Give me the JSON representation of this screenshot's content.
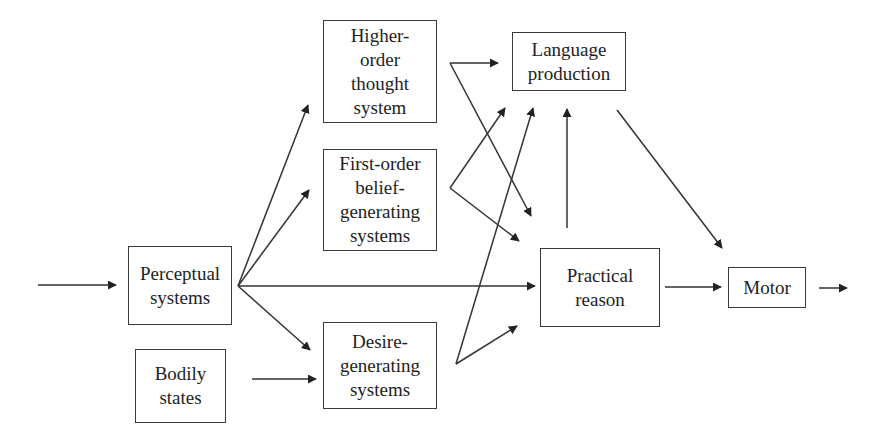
{
  "diagram": {
    "nodes": [
      {
        "id": "perceptual",
        "label": "Perceptual\nsystems"
      },
      {
        "id": "bodily",
        "label": "Bodily\nstates"
      },
      {
        "id": "higher_order",
        "label": "Higher-\norder\nthought\nsystem"
      },
      {
        "id": "first_order",
        "label": "First-order\nbelief-\ngenerating\nsystems"
      },
      {
        "id": "desire",
        "label": "Desire-\ngenerating\nsystems"
      },
      {
        "id": "language",
        "label": "Language\nproduction"
      },
      {
        "id": "practical",
        "label": "Practical\nreason"
      },
      {
        "id": "motor",
        "label": "Motor"
      }
    ],
    "edges": [
      {
        "from": "input",
        "to": "perceptual"
      },
      {
        "from": "perceptual",
        "to": "higher_order"
      },
      {
        "from": "perceptual",
        "to": "first_order"
      },
      {
        "from": "perceptual",
        "to": "practical"
      },
      {
        "from": "perceptual",
        "to": "desire"
      },
      {
        "from": "bodily",
        "to": "desire"
      },
      {
        "from": "higher_order",
        "to": "language"
      },
      {
        "from": "higher_order",
        "to": "practical"
      },
      {
        "from": "first_order",
        "to": "language"
      },
      {
        "from": "first_order",
        "to": "practical"
      },
      {
        "from": "desire",
        "to": "language"
      },
      {
        "from": "desire",
        "to": "practical"
      },
      {
        "from": "practical",
        "to": "language"
      },
      {
        "from": "practical",
        "to": "motor"
      },
      {
        "from": "language",
        "to": "motor"
      },
      {
        "from": "motor",
        "to": "output"
      }
    ],
    "colors": {
      "line": "#333333",
      "box_border": "#3a3a3a",
      "text": "#1e1e1e",
      "background": "#ffffff"
    }
  }
}
